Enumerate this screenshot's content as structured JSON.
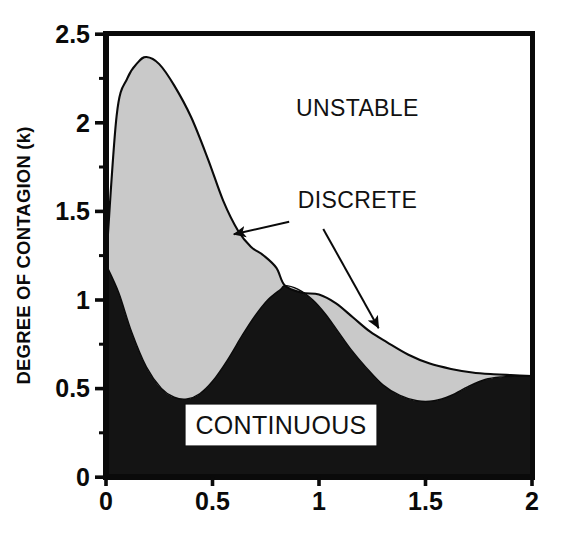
{
  "chart_data": {
    "type": "area",
    "title": "",
    "subtitle": "",
    "xlabel": "",
    "ylabel": "DEGREE OF CONTAGION (k)",
    "xlim": [
      0,
      2
    ],
    "ylim": [
      0,
      2.5
    ],
    "grid": false,
    "legend_position": "none",
    "x_ticks": [
      0,
      0.5,
      1,
      1.5,
      2
    ],
    "x_tick_labels": [
      "0",
      "0.5",
      "1",
      "1.5",
      "2"
    ],
    "x_minor_ticks": [
      0.25,
      0.75,
      1.25,
      1.75
    ],
    "y_ticks": [
      0,
      0.5,
      1,
      1.5,
      2,
      2.5
    ],
    "y_tick_labels": [
      "0",
      "0.5",
      "1",
      "1.5",
      "2",
      "2.5"
    ],
    "y_minor_ticks": [
      0.25,
      0.75,
      1.25,
      1.75,
      2.25
    ],
    "series": [
      {
        "name": "upper-boundary-discrete",
        "description": "Upper boundary of the DISCRETE (shaded) region; above it the system is UNSTABLE",
        "x": [
          0.0,
          0.05,
          0.1,
          0.15,
          0.19,
          0.25,
          0.32,
          0.4,
          0.48,
          0.55,
          0.62,
          0.68,
          0.74,
          0.8,
          0.84,
          0.92,
          1.0,
          1.08,
          1.16,
          1.24,
          1.32,
          1.42,
          1.52,
          1.62,
          1.72,
          1.82,
          1.9,
          2.0
        ],
        "y": [
          1.2,
          2.04,
          2.25,
          2.34,
          2.37,
          2.33,
          2.21,
          2.03,
          1.79,
          1.56,
          1.39,
          1.3,
          1.25,
          1.18,
          1.08,
          1.04,
          1.03,
          0.98,
          0.9,
          0.82,
          0.76,
          0.69,
          0.64,
          0.61,
          0.59,
          0.58,
          0.575,
          0.57
        ]
      },
      {
        "name": "lower-boundary-continuous",
        "description": "Upper boundary of the CONTINUOUS (solid black) region",
        "x": [
          0.0,
          0.06,
          0.12,
          0.19,
          0.26,
          0.32,
          0.38,
          0.44,
          0.5,
          0.57,
          0.64,
          0.7,
          0.76,
          0.82,
          0.84,
          0.9,
          0.97,
          1.03,
          1.09,
          1.15,
          1.22,
          1.3,
          1.38,
          1.46,
          1.54,
          1.62,
          1.7,
          1.78,
          1.86,
          1.94,
          2.0
        ],
        "y": [
          1.2,
          1.04,
          0.82,
          0.62,
          0.5,
          0.45,
          0.44,
          0.47,
          0.54,
          0.66,
          0.8,
          0.91,
          1.0,
          1.06,
          1.08,
          1.06,
          1.0,
          0.92,
          0.82,
          0.72,
          0.62,
          0.52,
          0.46,
          0.43,
          0.43,
          0.46,
          0.51,
          0.55,
          0.565,
          0.57,
          0.57
        ]
      }
    ],
    "regions": [
      {
        "name": "UNSTABLE",
        "fill": "#ffffff",
        "label": "UNSTABLE"
      },
      {
        "name": "DISCRETE",
        "fill": "#c9c9c9",
        "label": "DISCRETE"
      },
      {
        "name": "CONTINUOUS",
        "fill": "#141414",
        "label": "CONTINUOUS"
      }
    ],
    "annotations": [
      {
        "text": "UNSTABLE",
        "x": 1.18,
        "y": 2.04,
        "has_arrow": false
      },
      {
        "text": "DISCRETE",
        "x": 0.9,
        "y": 1.52,
        "has_arrow": true,
        "arrow_from": [
          0.86,
          1.44
        ],
        "arrow_to": [
          0.6,
          1.37
        ]
      },
      {
        "text": "CONTINUOUS",
        "x": 0.68,
        "y": 0.28,
        "has_arrow": false,
        "boxed": true
      }
    ],
    "arrows": [
      {
        "name": "discrete-arrow-left",
        "from": [
          0.86,
          1.44
        ],
        "to": [
          0.6,
          1.37
        ]
      },
      {
        "name": "discrete-arrow-right",
        "from": [
          1.02,
          1.4
        ],
        "to": [
          1.28,
          0.84
        ]
      }
    ],
    "colors": {
      "unstable_fill": "#ffffff",
      "discrete_fill": "#c9c9c9",
      "continuous_fill": "#141414",
      "axis": "#0a0a0a",
      "curve": "#0a0a0a",
      "text": "#111111"
    }
  },
  "axis": {
    "y_title": "DEGREE OF CONTAGION (k)",
    "x_title": ""
  },
  "labels": {
    "unstable": "UNSTABLE",
    "discrete": "DISCRETE",
    "continuous": "CONTINUOUS"
  },
  "ticks": {
    "y": [
      "2.5",
      "2",
      "1.5",
      "1",
      "0.5",
      "0"
    ],
    "x": [
      "0",
      "0.5",
      "1",
      "1.5",
      "2"
    ]
  }
}
